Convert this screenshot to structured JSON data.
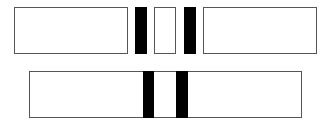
{
  "diagram": {
    "colors": {
      "box_fill": "#ffffff",
      "box_border": "#555555",
      "bar_fill": "#000000"
    },
    "top_row": [
      {
        "type": "box",
        "x": 14,
        "y": 7,
        "w": 114,
        "h": 47
      },
      {
        "type": "bar",
        "x": 135,
        "y": 7,
        "w": 12,
        "h": 47
      },
      {
        "type": "box",
        "x": 154,
        "y": 7,
        "w": 22,
        "h": 47
      },
      {
        "type": "bar",
        "x": 184,
        "y": 7,
        "w": 12,
        "h": 47
      },
      {
        "type": "box",
        "x": 203,
        "y": 7,
        "w": 114,
        "h": 47
      }
    ],
    "bottom_row": [
      {
        "type": "box",
        "x": 29,
        "y": 71,
        "w": 273,
        "h": 47
      },
      {
        "type": "bar",
        "x": 143,
        "y": 71,
        "w": 11,
        "h": 47
      },
      {
        "type": "bar",
        "x": 176,
        "y": 71,
        "w": 12,
        "h": 47
      }
    ]
  }
}
